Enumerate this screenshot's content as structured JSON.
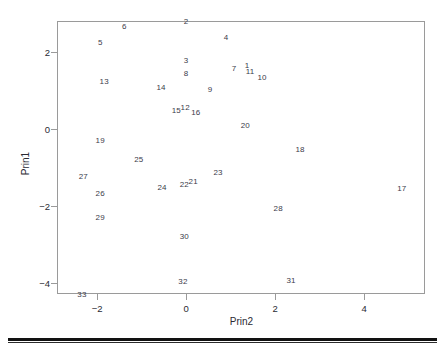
{
  "chart_data": {
    "type": "scatter",
    "title": "",
    "xlabel": "Prin2",
    "ylabel": "Prin1",
    "xlim": [
      -2.9,
      5.37
    ],
    "ylim": [
      -4.28,
      2.8
    ],
    "xticks": [
      -2,
      0,
      2,
      4
    ],
    "xticklabels": [
      "−2",
      "0",
      "2",
      "4"
    ],
    "yticks": [
      2,
      0,
      -2,
      -4
    ],
    "yticklabels": [
      "2",
      "0",
      "−2",
      "−4"
    ],
    "grid": false,
    "legend": false,
    "marker": "text-label",
    "points": [
      {
        "label": "1",
        "x": 1.37,
        "y": 1.67
      },
      {
        "label": "2",
        "x": 0.0,
        "y": 2.8
      },
      {
        "label": "3",
        "x": 0.0,
        "y": 1.79
      },
      {
        "label": "4",
        "x": 0.9,
        "y": 2.39
      },
      {
        "label": "5",
        "x": -1.93,
        "y": 2.25
      },
      {
        "label": "6",
        "x": -1.39,
        "y": 2.66
      },
      {
        "label": "7",
        "x": 1.08,
        "y": 1.59
      },
      {
        "label": "8",
        "x": 0.0,
        "y": 1.44
      },
      {
        "label": "9",
        "x": 0.54,
        "y": 1.04
      },
      {
        "label": "10",
        "x": 1.71,
        "y": 1.36
      },
      {
        "label": "11",
        "x": 1.44,
        "y": 1.5
      },
      {
        "label": "12",
        "x": -0.02,
        "y": 0.58
      },
      {
        "label": "13",
        "x": -1.84,
        "y": 1.24
      },
      {
        "label": "14",
        "x": -0.56,
        "y": 1.1
      },
      {
        "label": "15",
        "x": -0.22,
        "y": 0.49
      },
      {
        "label": "16",
        "x": 0.22,
        "y": 0.43
      },
      {
        "label": "17",
        "x": 4.85,
        "y": -1.53
      },
      {
        "label": "18",
        "x": 2.56,
        "y": -0.52
      },
      {
        "label": "19",
        "x": -1.93,
        "y": -0.29
      },
      {
        "label": "20",
        "x": 1.33,
        "y": 0.09
      },
      {
        "label": "21",
        "x": 0.16,
        "y": -1.35
      },
      {
        "label": "22",
        "x": -0.04,
        "y": -1.44
      },
      {
        "label": "23",
        "x": 0.72,
        "y": -1.12
      },
      {
        "label": "24",
        "x": -0.54,
        "y": -1.5
      },
      {
        "label": "25",
        "x": -1.06,
        "y": -0.78
      },
      {
        "label": "26",
        "x": -1.93,
        "y": -1.67
      },
      {
        "label": "27",
        "x": -2.31,
        "y": -1.21
      },
      {
        "label": "28",
        "x": 2.07,
        "y": -2.05
      },
      {
        "label": "29",
        "x": -1.93,
        "y": -2.28
      },
      {
        "label": "30",
        "x": -0.04,
        "y": -2.77
      },
      {
        "label": "31",
        "x": 2.36,
        "y": -3.92
      },
      {
        "label": "32",
        "x": -0.07,
        "y": -3.95
      },
      {
        "label": "33",
        "x": -2.34,
        "y": -4.28
      }
    ]
  },
  "axes": {
    "x_title": "Prin2",
    "y_title": "Prin1"
  },
  "colors": {
    "frame": "#9a9a9a",
    "label_text": "#3b3b4a",
    "tick_text": "#2a2a33",
    "rule": "#121212",
    "background": "#ffffff"
  }
}
